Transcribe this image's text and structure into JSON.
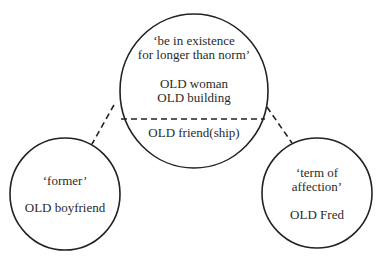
{
  "diagram": {
    "title": "",
    "colors": {
      "stroke": "#222222",
      "text": "#2a2a2a",
      "background": "#ffffff"
    },
    "nodes": [
      {
        "id": "center",
        "sense": "‘be in existence for longer than norm’",
        "sense_lines": [
          "‘be in existence",
          "for longer than norm’"
        ],
        "examples": [
          "OLD woman",
          "OLD building"
        ],
        "below_divider": "OLD friend(ship)"
      },
      {
        "id": "left",
        "sense": "‘former’",
        "sense_lines": [
          "‘former’"
        ],
        "examples": [
          "OLD boyfriend"
        ]
      },
      {
        "id": "right",
        "sense": "‘term of affection’",
        "sense_lines": [
          "‘term of",
          "affection’"
        ],
        "examples": [
          "OLD Fred"
        ]
      }
    ],
    "edges": [
      {
        "from": "center",
        "to": "left",
        "style": "dashed"
      },
      {
        "from": "center",
        "to": "right",
        "style": "dashed"
      }
    ],
    "divider": {
      "node": "center",
      "style": "dashed"
    }
  }
}
